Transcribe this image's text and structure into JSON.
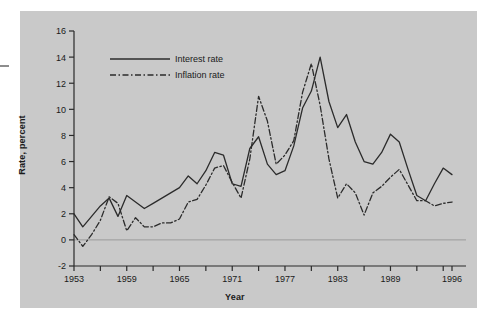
{
  "figure": {
    "background_color": "#c9c9c9",
    "page_color": "#ffffff",
    "line_color": "#2b2b2b",
    "zero_line_color": "#9a9a9a"
  },
  "axes": {
    "ylabel": "Rate, percent",
    "xlabel": "Year"
  },
  "legend": {
    "items": [
      {
        "label": "Interest rate",
        "style": "solid"
      },
      {
        "label": "Inflation rate",
        "style": "dash-dot"
      }
    ]
  },
  "chart_data": {
    "type": "line",
    "title": "",
    "xlabel": "Year",
    "ylabel": "Rate, percent",
    "xlim": [
      1953,
      1996
    ],
    "ylim": [
      -2,
      16
    ],
    "ytick_labels": [
      "16",
      "14",
      "12",
      "10",
      "8",
      "6",
      "4",
      "2",
      "0",
      "-2"
    ],
    "yticks": [
      16,
      14,
      12,
      10,
      8,
      6,
      4,
      2,
      0,
      -2
    ],
    "xtick_labels": [
      "1953",
      "1959",
      "1965",
      "1971",
      "1977",
      "1983",
      "1989",
      "1996"
    ],
    "xticks": [
      1953,
      1959,
      1965,
      1971,
      1977,
      1983,
      1989,
      1996
    ],
    "xminor_step": 3,
    "grid": false,
    "legend_position": "upper left",
    "zero_line": 0,
    "x": [
      1953,
      1954,
      1955,
      1956,
      1957,
      1958,
      1959,
      1960,
      1961,
      1962,
      1963,
      1964,
      1965,
      1966,
      1967,
      1968,
      1969,
      1970,
      1971,
      1972,
      1973,
      1974,
      1975,
      1976,
      1977,
      1978,
      1979,
      1980,
      1981,
      1982,
      1983,
      1984,
      1985,
      1986,
      1987,
      1988,
      1989,
      1990,
      1991,
      1992,
      1993,
      1994,
      1995,
      1996
    ],
    "series": [
      {
        "name": "Interest rate",
        "style": "solid",
        "values": [
          2.0,
          1.0,
          1.8,
          2.6,
          3.2,
          1.8,
          3.4,
          2.9,
          2.4,
          2.8,
          3.2,
          3.6,
          4.0,
          4.9,
          4.3,
          5.3,
          6.7,
          6.5,
          4.3,
          4.1,
          7.0,
          7.9,
          5.8,
          5.0,
          5.3,
          7.2,
          10.1,
          11.4,
          14.0,
          10.6,
          8.6,
          9.6,
          7.5,
          6.0,
          5.8,
          6.7,
          8.1,
          7.5,
          5.4,
          3.4,
          3.0,
          4.3,
          5.5,
          5.0
        ]
      },
      {
        "name": "Inflation rate",
        "style": "dash-dot",
        "values": [
          0.4,
          -0.5,
          0.4,
          1.5,
          3.3,
          2.8,
          0.7,
          1.7,
          1.0,
          1.0,
          1.3,
          1.3,
          1.6,
          2.9,
          3.1,
          4.2,
          5.5,
          5.7,
          4.4,
          3.2,
          6.2,
          11.0,
          9.1,
          5.8,
          6.5,
          7.6,
          11.3,
          13.5,
          10.3,
          6.2,
          3.2,
          4.3,
          3.6,
          1.9,
          3.6,
          4.1,
          4.8,
          5.4,
          4.2,
          3.0,
          3.0,
          2.6,
          2.8,
          2.9
        ]
      }
    ]
  }
}
